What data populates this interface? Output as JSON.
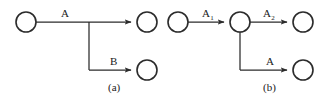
{
  "figure": {
    "background_color": "#ffffff",
    "stroke_color": "#2b2b2b",
    "text_color": "#1a1a1a",
    "node_fill": "#ffffff"
  },
  "panels": [
    {
      "id": "a",
      "caption": "(a)",
      "caption_x": 108,
      "caption_y": 82,
      "nodes": [
        {
          "name": "source-node",
          "cx": 26,
          "cy": 22,
          "r": 10
        },
        {
          "name": "top-target-node",
          "cx": 147,
          "cy": 22,
          "r": 10
        },
        {
          "name": "bottom-target-node",
          "cx": 147,
          "cy": 70,
          "r": 10
        }
      ],
      "edges": [
        {
          "name": "edge-a",
          "label": "A",
          "label_x": 61,
          "label_y": 8,
          "subscript": ""
        },
        {
          "name": "edge-b",
          "label": "B",
          "label_x": 110,
          "label_y": 56,
          "subscript": ""
        }
      ],
      "junction_x": 89,
      "junction_top_y": 22,
      "junction_bottom_y": 70
    },
    {
      "id": "b",
      "caption": "(b)",
      "caption_x": 101,
      "caption_y": 82,
      "nodes": [
        {
          "name": "source-node",
          "cx": 16,
          "cy": 22,
          "r": 10
        },
        {
          "name": "middle-node",
          "cx": 78,
          "cy": 22,
          "r": 10
        },
        {
          "name": "top-target-node",
          "cx": 141,
          "cy": 22,
          "r": 10
        },
        {
          "name": "bottom-target-node",
          "cx": 141,
          "cy": 70,
          "r": 10
        }
      ],
      "edges": [
        {
          "name": "edge-a1",
          "label": "A",
          "subscript": "1",
          "label_x": 40,
          "label_y": 8
        },
        {
          "name": "edge-a2",
          "label": "A",
          "subscript": "2",
          "label_x": 101,
          "label_y": 8
        },
        {
          "name": "edge-a-lower",
          "label": "A",
          "subscript": "",
          "label_x": 104,
          "label_y": 56
        }
      ],
      "junction_x": 78,
      "junction_top_y": 32,
      "junction_bottom_y": 70
    }
  ]
}
